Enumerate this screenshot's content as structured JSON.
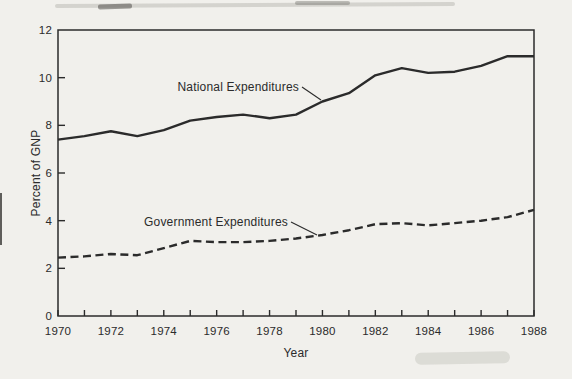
{
  "figure": {
    "paper_color": "#f1f0ec",
    "ink_color": "#2b2b2b",
    "annotations": [
      {
        "text": "National Expenditures",
        "text_x": 299,
        "text_y": 91,
        "anchor": "end",
        "leader": [
          302,
          87,
          321,
          100
        ]
      },
      {
        "text": "Government Expenditures",
        "text_x": 288,
        "text_y": 226,
        "anchor": "end",
        "leader": [
          291,
          222,
          317,
          235
        ]
      }
    ]
  },
  "chart_data": {
    "type": "line",
    "title": "",
    "xlabel": "Year",
    "ylabel": "Percent of GNP",
    "xlim": [
      1970,
      1988
    ],
    "ylim": [
      0,
      12
    ],
    "yticks": [
      0,
      2,
      4,
      6,
      8,
      10,
      12
    ],
    "xticks_minor_every": 1,
    "xtick_labels": [
      1970,
      1972,
      1974,
      1976,
      1978,
      1980,
      1982,
      1984,
      1986,
      1988
    ],
    "grid": false,
    "legend": "none (labels drawn inline with leader lines)",
    "x": [
      1970,
      1971,
      1972,
      1973,
      1974,
      1975,
      1976,
      1977,
      1978,
      1979,
      1980,
      1981,
      1982,
      1983,
      1984,
      1985,
      1986,
      1987,
      1988
    ],
    "series": [
      {
        "name": "National Expenditures",
        "style": "solid",
        "values": [
          7.4,
          7.55,
          7.75,
          7.55,
          7.8,
          8.2,
          8.35,
          8.45,
          8.3,
          8.45,
          9.0,
          9.35,
          10.1,
          10.4,
          10.2,
          10.25,
          10.5,
          10.9,
          10.9
        ]
      },
      {
        "name": "Government Expenditures",
        "style": "dashed",
        "values": [
          2.45,
          2.5,
          2.6,
          2.55,
          2.85,
          3.15,
          3.1,
          3.1,
          3.15,
          3.25,
          3.4,
          3.6,
          3.85,
          3.9,
          3.8,
          3.9,
          4.0,
          4.15,
          4.45
        ]
      }
    ]
  }
}
